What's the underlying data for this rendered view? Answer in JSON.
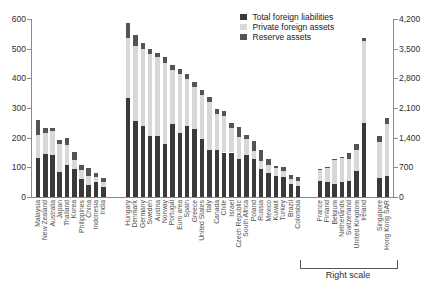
{
  "chart_data": {
    "type": "bar",
    "stacked": true,
    "title": "",
    "legend_position": "top-right",
    "grid": false,
    "series": [
      {
        "label": "Total foreign liabilities",
        "color": "#3a3a3a"
      },
      {
        "label": "Private foreign assets",
        "color": "#d8d8d8"
      },
      {
        "label": "Reserve assets",
        "color": "#545454"
      }
    ],
    "left_axis": {
      "min": 0,
      "max": 600,
      "ticks": [
        "0",
        "100",
        "200",
        "300",
        "400",
        "500",
        "600"
      ]
    },
    "right_axis": {
      "min": 0,
      "max": 4200,
      "ticks": [
        "0",
        "700",
        "1,400",
        "2,100",
        "2,800",
        "3,500",
        "4,200"
      ]
    },
    "right_scale_label": "Right scale",
    "groups": [
      {
        "scale": "left",
        "bars": [
          {
            "name": "Malaysia",
            "values": [
              130,
              78,
              52
            ]
          },
          {
            "name": "New Zealand",
            "values": [
              145,
              71,
              15
            ]
          },
          {
            "name": "Australia",
            "values": [
              140,
              83,
              9
            ]
          },
          {
            "name": "Japan",
            "values": [
              83,
              97,
              13
            ]
          },
          {
            "name": "Thailand",
            "values": [
              108,
              66,
              25
            ]
          },
          {
            "name": "Korea",
            "values": [
              94,
              31,
              26
            ]
          },
          {
            "name": "Philippines",
            "values": [
              60,
              31,
              17
            ]
          },
          {
            "name": "China",
            "values": [
              41,
              31,
              26
            ]
          },
          {
            "name": "Indonesia",
            "values": [
              49,
              17,
              14
            ]
          },
          {
            "name": "India",
            "values": [
              34,
              15,
              14
            ]
          }
        ]
      },
      {
        "scale": "left",
        "bars": [
          {
            "name": "Hungary",
            "values": [
              335,
              200,
              50
            ]
          },
          {
            "name": "Denmark",
            "values": [
              255,
              254,
              36
            ]
          },
          {
            "name": "Germany",
            "values": [
              240,
              258,
              22
            ]
          },
          {
            "name": "Sweden",
            "values": [
              205,
              278,
              17
            ]
          },
          {
            "name": "Austria",
            "values": [
              205,
              266,
              16
            ]
          },
          {
            "name": "Norway",
            "values": [
              178,
              274,
              20
            ]
          },
          {
            "name": "Portugal",
            "values": [
              245,
              184,
              16
            ]
          },
          {
            "name": "Euro area",
            "values": [
              215,
              199,
              16
            ]
          },
          {
            "name": "Spain",
            "values": [
              238,
              160,
              16
            ]
          },
          {
            "name": "Greece",
            "values": [
              228,
              144,
              16
            ]
          },
          {
            "name": "United States",
            "values": [
              195,
              150,
              17
            ]
          },
          {
            "name": "Italy",
            "values": [
              160,
              159,
              17
            ]
          },
          {
            "name": "Canada",
            "values": [
              158,
              123,
              17
            ]
          },
          {
            "name": "Chile",
            "values": [
              150,
              124,
              16
            ]
          },
          {
            "name": "Israel",
            "values": [
              150,
              82,
              18
            ]
          },
          {
            "name": "Czech Republic",
            "values": [
              128,
              75,
              32
            ]
          },
          {
            "name": "South Africa",
            "values": [
              140,
              55,
              15
            ]
          },
          {
            "name": "Poland",
            "values": [
              128,
              27,
              35
            ]
          },
          {
            "name": "Russia",
            "values": [
              94,
              29,
              34
            ]
          },
          {
            "name": "Mexico",
            "values": [
              80,
              29,
              19
            ]
          },
          {
            "name": "Kuwait",
            "values": [
              72,
              26,
              8
            ]
          },
          {
            "name": "Turkey",
            "values": [
              66,
              20,
              14
            ]
          },
          {
            "name": "Brazil",
            "values": [
              43,
              17,
              15
            ]
          },
          {
            "name": "Colombia",
            "values": [
              38,
              17,
              11
            ]
          }
        ]
      },
      {
        "scale": "right",
        "bars": [
          {
            "name": "France",
            "values": [
              385,
              250,
              25
            ]
          },
          {
            "name": "Finland",
            "values": [
              365,
              320,
              30
            ]
          },
          {
            "name": "Belgium",
            "values": [
              315,
              555,
              30
            ]
          },
          {
            "name": "Netherlands",
            "values": [
              350,
              565,
              30
            ]
          },
          {
            "name": "Switzerland",
            "values": [
              385,
              500,
              165
            ]
          },
          {
            "name": "United Kingdom",
            "values": [
              620,
              480,
              160
            ]
          },
          {
            "name": "Ireland",
            "values": [
              1735,
              1950,
              75
            ]
          }
        ]
      },
      {
        "scale": "right",
        "bars": [
          {
            "name": "Singapore",
            "values": [
              450,
              845,
              140
            ]
          },
          {
            "name": "Hong Kong SAR",
            "values": [
              505,
              1210,
              160
            ]
          }
        ]
      }
    ]
  }
}
